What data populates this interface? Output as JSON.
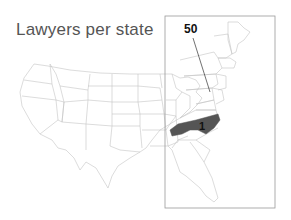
{
  "title": "Lawyers per state",
  "highlight": {
    "state": "North Carolina",
    "rank_label": "1",
    "fill": "#555555"
  },
  "callout": {
    "label": "50",
    "target": "Delaware/Maryland area"
  },
  "colors": {
    "state_border": "#bdbdbd",
    "inset_border": "#999999",
    "title": "#555555"
  }
}
